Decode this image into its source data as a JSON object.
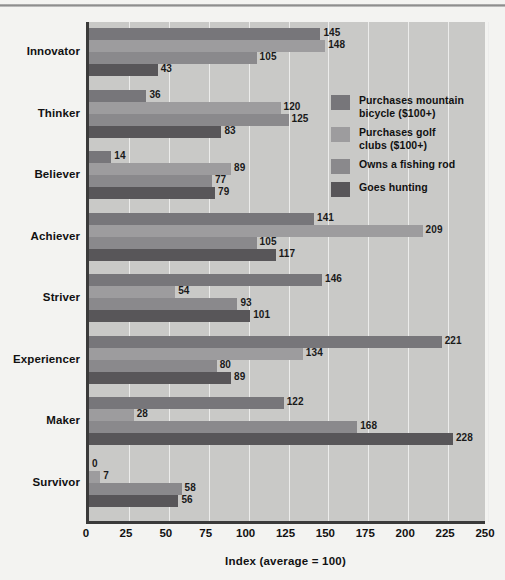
{
  "chart_data": {
    "type": "bar",
    "orientation": "horizontal",
    "title": "",
    "xlabel": "Index (average = 100)",
    "ylabel": "",
    "xlim": [
      0,
      250
    ],
    "xticks": [
      0,
      25,
      50,
      75,
      100,
      125,
      150,
      175,
      200,
      225,
      250
    ],
    "grid": true,
    "legend_position": "inside-right-top",
    "categories": [
      "Innovator",
      "Thinker",
      "Believer",
      "Achiever",
      "Striver",
      "Experiencer",
      "Maker",
      "Survivor"
    ],
    "series": [
      {
        "name": "Purchases mountain bicycle ($100+)",
        "color": "#77767a",
        "values": [
          145,
          36,
          14,
          141,
          146,
          221,
          122,
          0
        ]
      },
      {
        "name": "Purchases golf clubs ($100+)",
        "color": "#9d9c9e",
        "values": [
          148,
          120,
          89,
          209,
          54,
          134,
          28,
          7
        ]
      },
      {
        "name": "Owns a fishing rod",
        "color": "#8a898c",
        "values": [
          105,
          125,
          77,
          105,
          93,
          80,
          168,
          58
        ]
      },
      {
        "name": "Goes hunting",
        "color": "#585659",
        "values": [
          43,
          83,
          79,
          117,
          101,
          89,
          228,
          56
        ]
      }
    ]
  },
  "legend": {
    "items": [
      {
        "label_line1": "Purchases mountain",
        "label_line2": "bicycle ($100+)"
      },
      {
        "label_line1": "Purchases golf",
        "label_line2": "clubs ($100+)"
      },
      {
        "label_line1": "Owns a fishing rod",
        "label_line2": ""
      },
      {
        "label_line1": "Goes hunting",
        "label_line2": ""
      }
    ]
  }
}
